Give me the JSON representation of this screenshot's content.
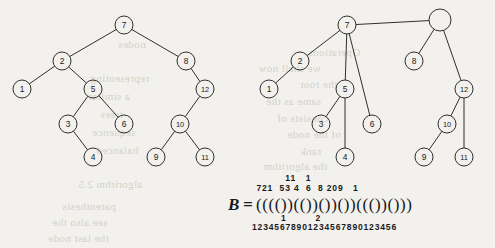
{
  "figure": {
    "background_color": "#f2f1ed",
    "ink_color": "#1a1a1a",
    "left_tree": {
      "caption": "ordinal tree",
      "nodes": [
        {
          "id": "n7",
          "label": "7",
          "cx": 124,
          "cy": 25,
          "r": 9
        },
        {
          "id": "n2",
          "label": "2",
          "cx": 62,
          "cy": 61,
          "r": 9
        },
        {
          "id": "n8",
          "label": "8",
          "cx": 186,
          "cy": 61,
          "r": 9
        },
        {
          "id": "n1",
          "label": "1",
          "cx": 22,
          "cy": 89,
          "r": 9
        },
        {
          "id": "n5",
          "label": "5",
          "cx": 93,
          "cy": 89,
          "r": 9
        },
        {
          "id": "n12",
          "label": "12",
          "cx": 205,
          "cy": 89,
          "r": 9
        },
        {
          "id": "n3",
          "label": "3",
          "cx": 68,
          "cy": 124,
          "r": 9
        },
        {
          "id": "n6",
          "label": "6",
          "cx": 124,
          "cy": 124,
          "r": 9
        },
        {
          "id": "n10",
          "label": "10",
          "cx": 180,
          "cy": 124,
          "r": 9
        },
        {
          "id": "n4",
          "label": "4",
          "cx": 93,
          "cy": 157,
          "r": 9
        },
        {
          "id": "n9",
          "label": "9",
          "cx": 156,
          "cy": 157,
          "r": 9
        },
        {
          "id": "n11",
          "label": "11",
          "cx": 205,
          "cy": 157,
          "r": 9
        }
      ],
      "edges": [
        [
          "n7",
          "n2"
        ],
        [
          "n7",
          "n8"
        ],
        [
          "n2",
          "n1"
        ],
        [
          "n2",
          "n5"
        ],
        [
          "n5",
          "n3"
        ],
        [
          "n5",
          "n6"
        ],
        [
          "n3",
          "n4"
        ],
        [
          "n8",
          "n12"
        ],
        [
          "n12",
          "n10"
        ],
        [
          "n10",
          "n9"
        ],
        [
          "n10",
          "n11"
        ]
      ]
    },
    "right_tree": {
      "caption": "first-child next-sibling representation",
      "nodes": [
        {
          "id": "r_root",
          "label": "",
          "cx": 440,
          "cy": 20,
          "r": 11
        },
        {
          "id": "r7",
          "label": "7",
          "cx": 347,
          "cy": 25,
          "r": 9
        },
        {
          "id": "r2",
          "label": "2",
          "cx": 300,
          "cy": 61,
          "r": 9
        },
        {
          "id": "r8",
          "label": "8",
          "cx": 414,
          "cy": 61,
          "r": 9
        },
        {
          "id": "r1",
          "label": "1",
          "cx": 269,
          "cy": 89,
          "r": 9
        },
        {
          "id": "r5",
          "label": "5",
          "cx": 345,
          "cy": 89,
          "r": 9
        },
        {
          "id": "r12",
          "label": "12",
          "cx": 464,
          "cy": 89,
          "r": 9
        },
        {
          "id": "r3",
          "label": "3",
          "cx": 321,
          "cy": 124,
          "r": 9
        },
        {
          "id": "r6",
          "label": "6",
          "cx": 372,
          "cy": 124,
          "r": 9
        },
        {
          "id": "r10",
          "label": "10",
          "cx": 447,
          "cy": 124,
          "r": 9
        },
        {
          "id": "r4",
          "label": "4",
          "cx": 345,
          "cy": 157,
          "r": 9
        },
        {
          "id": "r9",
          "label": "9",
          "cx": 424,
          "cy": 157,
          "r": 9
        },
        {
          "id": "r11",
          "label": "11",
          "cx": 464,
          "cy": 157,
          "r": 9
        }
      ],
      "edges": [
        [
          "r_root",
          "r7"
        ],
        [
          "r_root",
          "r8"
        ],
        [
          "r_root",
          "r12"
        ],
        [
          "r7",
          "r2"
        ],
        [
          "r7",
          "r5"
        ],
        [
          "r7",
          "r6"
        ],
        [
          "r2",
          "r1"
        ],
        [
          "r5",
          "r3"
        ],
        [
          "r5",
          "r4"
        ],
        [
          "r12",
          "r10"
        ],
        [
          "r12",
          "r11"
        ],
        [
          "r10",
          "r9"
        ]
      ]
    },
    "equation": {
      "name_symbol": "B",
      "equals": "=",
      "sequence": "(((())(())())())((())()))",
      "sequence_chars": [
        "(",
        "(",
        "(",
        "(",
        ")",
        ")",
        "(",
        "(",
        ")",
        ")",
        "(",
        ")",
        ")",
        "(",
        ")",
        ")",
        "(",
        "(",
        "(",
        ")",
        ")",
        "(",
        ")",
        ")",
        ")"
      ],
      "node_labels_top": [
        {
          "text": "7",
          "pos": 1
        },
        {
          "text": "2",
          "pos": 2
        },
        {
          "text": "1",
          "pos": 3
        },
        {
          "text": "5",
          "pos": 6
        },
        {
          "text": "3",
          "pos": 7
        },
        {
          "text": "4",
          "pos": 9
        },
        {
          "text": "6",
          "pos": 12
        },
        {
          "text": "8",
          "pos": 15
        },
        {
          "text": "12",
          "pos": 17
        },
        {
          "text": "10",
          "pos": 18
        },
        {
          "text": "9",
          "pos": 19
        },
        {
          "text": "11",
          "pos": 22
        }
      ],
      "labels_row_upper": "           11   1",
      "labels_row_lower": "  721  53 4  6  8 209   1",
      "index_row_tens": "         1         2",
      "index_row_units": "1234567890123456789012345 6",
      "index_ruler": "12345678901234567890123456"
    },
    "bleed_text": [
      {
        "text": "Operations",
        "x": 308,
        "y": 46
      },
      {
        "text": "we shall now",
        "x": 258,
        "y": 62
      },
      {
        "text": "the root",
        "x": 300,
        "y": 78
      },
      {
        "text": "same as the",
        "x": 266,
        "y": 95
      },
      {
        "text": "consists of",
        "x": 277,
        "y": 112
      },
      {
        "text": "of the node",
        "x": 287,
        "y": 128
      },
      {
        "text": "rank",
        "x": 300,
        "y": 145
      },
      {
        "text": "the algorithm",
        "x": 263,
        "y": 160
      },
      {
        "text": "nodes",
        "x": 118,
        "y": 38
      },
      {
        "text": "representing",
        "x": 90,
        "y": 72
      },
      {
        "text": "a similar",
        "x": 88,
        "y": 90
      },
      {
        "text": "trees",
        "x": 100,
        "y": 108
      },
      {
        "text": "sequence",
        "x": 92,
        "y": 126
      },
      {
        "text": "balanced",
        "x": 96,
        "y": 144
      },
      {
        "text": "algorithm 2.5",
        "x": 78,
        "y": 178
      },
      {
        "text": "parenthesis",
        "x": 62,
        "y": 200
      },
      {
        "text": "see also the",
        "x": 52,
        "y": 216
      },
      {
        "text": "the last node",
        "x": 48,
        "y": 232
      }
    ]
  }
}
